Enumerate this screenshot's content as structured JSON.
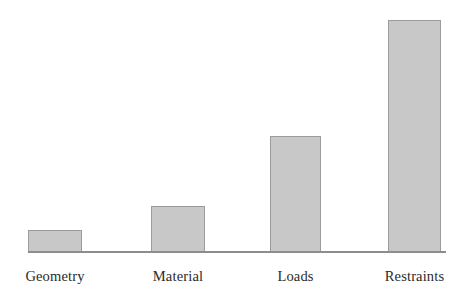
{
  "chart_data": {
    "type": "bar",
    "title": "",
    "subtitle": "",
    "xlabel": "",
    "ylabel": "",
    "grid": false,
    "legend": false,
    "axis": {
      "y_axis_visible": false,
      "x_axis_visible": true,
      "ylim": [
        0,
        240
      ],
      "y_ticks": [],
      "x_tick_labels": [
        "Geometry",
        "Material",
        "Loads",
        "Restraints"
      ]
    },
    "categories": [
      "Geometry",
      "Material",
      "Loads",
      "Restraints"
    ],
    "values": [
      22,
      46,
      116,
      232
    ],
    "series": [
      {
        "name": "",
        "values": [
          22,
          46,
          116,
          232
        ]
      }
    ],
    "bars": [
      {
        "label": "Geometry",
        "value": 22,
        "left_px": 28,
        "width_px": 54,
        "height_px": 22,
        "top_px": 230
      },
      {
        "label": "Material",
        "value": 46,
        "left_px": 151,
        "width_px": 54,
        "height_px": 46,
        "top_px": 206
      },
      {
        "label": "Loads",
        "value": 116,
        "left_px": 270,
        "width_px": 51,
        "height_px": 116,
        "top_px": 136
      },
      {
        "label": "Restraints",
        "value": 232,
        "left_px": 388,
        "width_px": 53,
        "height_px": 232,
        "top_px": 20
      }
    ],
    "colors": {
      "bar_fill": "#c8c8c8",
      "bar_border": "#9c9c9c",
      "axis_line": "#8d8d8d",
      "label_text": "#2a2a2a",
      "background": "#ffffff"
    }
  }
}
